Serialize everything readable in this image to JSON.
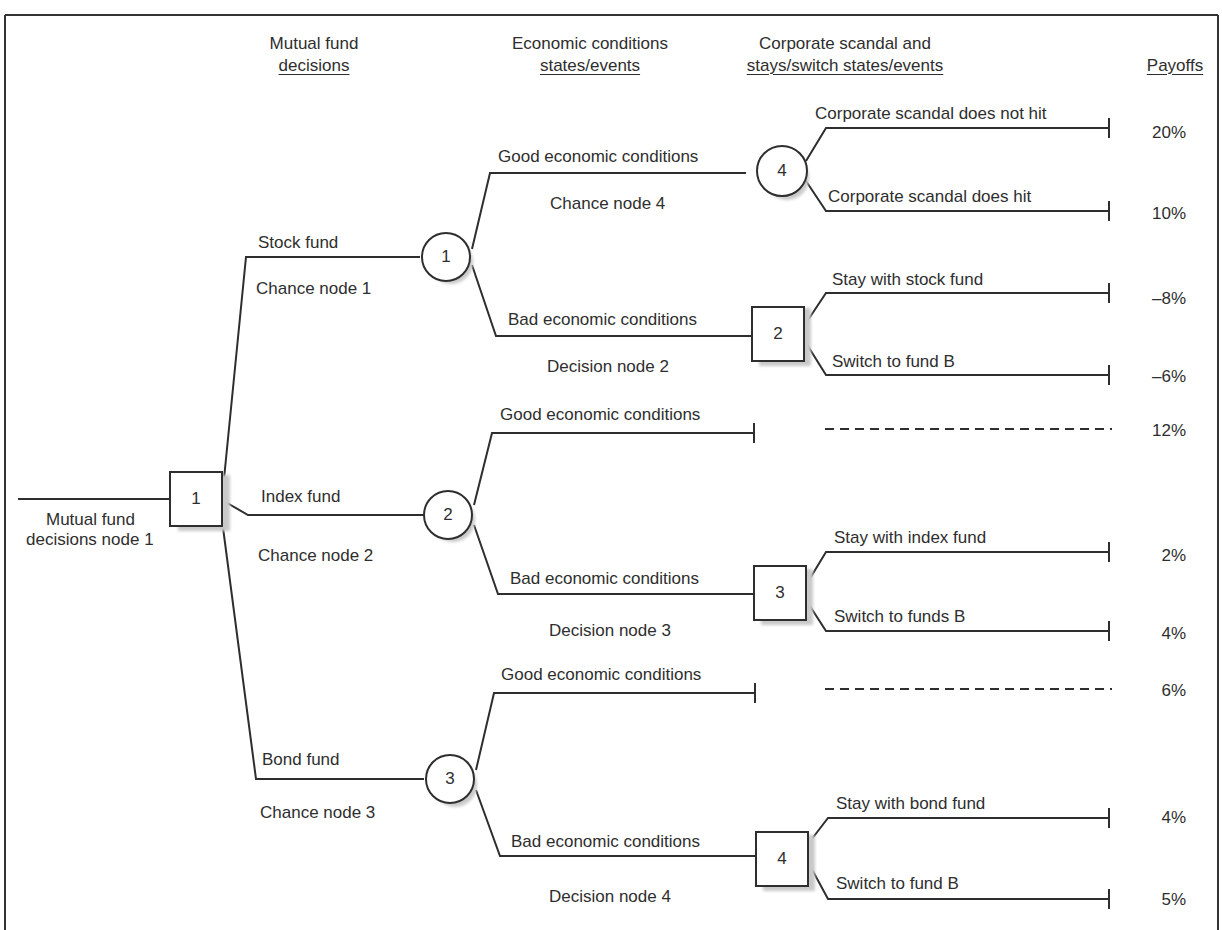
{
  "figure": {
    "frame_color": "#333333",
    "line_color": "#2e2e2e",
    "shadow_color": "#c9c9c9"
  },
  "headers": {
    "col1_line1": "Mutual fund",
    "col1_line2": "decisions",
    "col2_line1": "Economic conditions",
    "col2_line2": "states/events",
    "col3_line1": "Corporate scandal and",
    "col3_line2": "stays/switch states/events",
    "col4": "Payoffs"
  },
  "root": {
    "node_type": "decision",
    "number": "1",
    "label_line1": "Mutual fund",
    "label_line2": "decisions node 1"
  },
  "funds": [
    {
      "branch": "Stock fund",
      "node_label": "Chance node 1",
      "node_number": "1"
    },
    {
      "branch": "Index fund",
      "node_label": "Chance node 2",
      "node_number": "2"
    },
    {
      "branch": "Bond fund",
      "node_label": "Chance node 3",
      "node_number": "3"
    }
  ],
  "economy": [
    {
      "branch": "Good economic conditions",
      "node_label": "Chance node 4",
      "node_number": "4",
      "node_type": "chance"
    },
    {
      "branch": "Bad economic conditions",
      "node_label": "Decision node 2",
      "node_number": "2",
      "node_type": "decision"
    },
    {
      "branch": "Good economic conditions",
      "node_type": "terminal"
    },
    {
      "branch": "Bad economic conditions",
      "node_label": "Decision node 3",
      "node_number": "3",
      "node_type": "decision"
    },
    {
      "branch": "Good economic conditions",
      "node_type": "terminal"
    },
    {
      "branch": "Bad economic conditions",
      "node_label": "Decision node 4",
      "node_number": "4",
      "node_type": "decision"
    }
  ],
  "outcomes": [
    {
      "label": "Corporate scandal does not hit",
      "payoff": "20%"
    },
    {
      "label": "Corporate scandal does hit",
      "payoff": "10%"
    },
    {
      "label": "Stay with stock fund",
      "payoff": "–8%"
    },
    {
      "label": "Switch to fund B",
      "payoff": "–6%"
    },
    {
      "label": "",
      "payoff": "12%",
      "dashed": true
    },
    {
      "label": "Stay with index fund",
      "payoff": "2%"
    },
    {
      "label": "Switch to funds B",
      "payoff": "4%"
    },
    {
      "label": "",
      "payoff": "6%",
      "dashed": true
    },
    {
      "label": "Stay with bond fund",
      "payoff": "4%"
    },
    {
      "label": "Switch to fund B",
      "payoff": "5%"
    }
  ]
}
